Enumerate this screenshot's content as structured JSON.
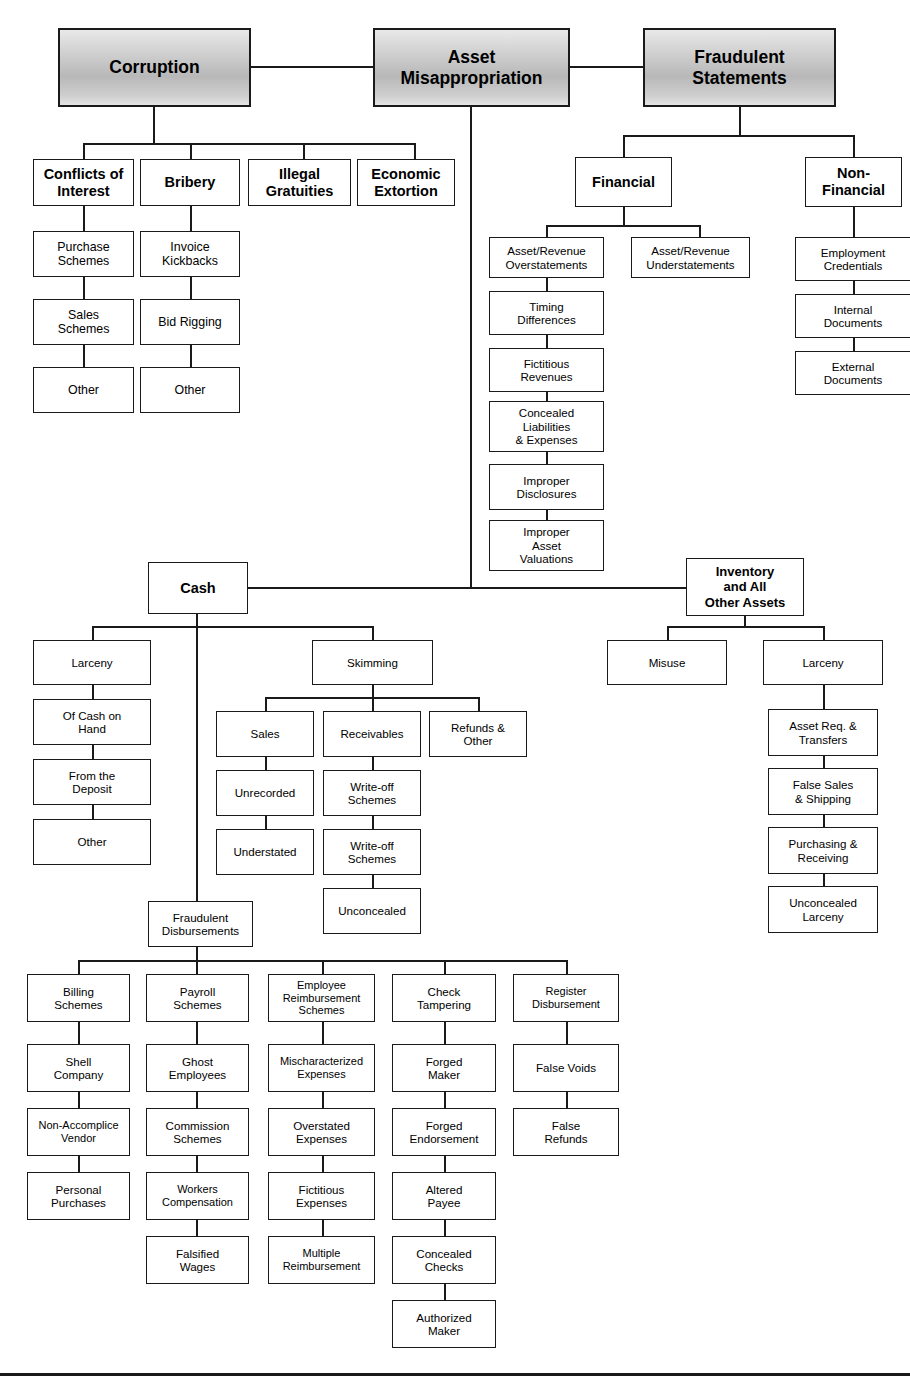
{
  "diagram": {
    "colors": {
      "line": "#1a1a1a",
      "box_fill": "#ffffff",
      "header_fill": "#c8c8c8",
      "text": "#000000"
    }
  },
  "top": {
    "corruption": "Corruption",
    "asset_misappropriation": "Asset\nMisappropriation",
    "asset_misappropriation_l1": "Asset",
    "asset_misappropriation_l2": "Misappropriation",
    "fraudulent_statements_l1": "Fraudulent",
    "fraudulent_statements_l2": "Statements"
  },
  "corruption_branch": {
    "conflicts_of_interest_l1": "Conflicts of",
    "conflicts_of_interest_l2": "Interest",
    "bribery": "Bribery",
    "illegal_gratuities_l1": "Illegal",
    "illegal_gratuities_l2": "Gratuities",
    "economic_extortion_l1": "Economic",
    "economic_extortion_l2": "Extortion",
    "conflicts_children": {
      "purchase_schemes_l1": "Purchase",
      "purchase_schemes_l2": "Schemes",
      "sales_schemes_l1": "Sales",
      "sales_schemes_l2": "Schemes",
      "other": "Other"
    },
    "bribery_children": {
      "invoice_kickbacks_l1": "Invoice",
      "invoice_kickbacks_l2": "Kickbacks",
      "bid_rigging": "Bid Rigging",
      "other": "Other"
    }
  },
  "fraudulent_statements_branch": {
    "financial": "Financial",
    "non_financial_l1": "Non-",
    "non_financial_l2": "Financial",
    "financial_children": {
      "overstatements_l1": "Asset/Revenue",
      "overstatements_l2": "Overstatements",
      "understatements_l1": "Asset/Revenue",
      "understatements_l2": "Understatements",
      "timing_differences_l1": "Timing",
      "timing_differences_l2": "Differences",
      "fictitious_revenues_l1": "Fictitious",
      "fictitious_revenues_l2": "Revenues",
      "concealed_liabilities_l1": "Concealed",
      "concealed_liabilities_l2": "Liabilities",
      "concealed_liabilities_l3": "& Expenses",
      "improper_disclosures_l1": "Improper",
      "improper_disclosures_l2": "Disclosures",
      "improper_asset_valuations_l1": "Improper",
      "improper_asset_valuations_l2": "Asset",
      "improper_asset_valuations_l3": "Valuations"
    },
    "non_financial_children": {
      "employment_credentials_l1": "Employment",
      "employment_credentials_l2": "Credentials",
      "internal_documents_l1": "Internal",
      "internal_documents_l2": "Documents",
      "external_documents_l1": "External",
      "external_documents_l2": "Documents"
    }
  },
  "cash_branch": {
    "cash": "Cash",
    "larceny": "Larceny",
    "larceny_children": {
      "of_cash_on_hand_l1": "Of Cash on",
      "of_cash_on_hand_l2": "Hand",
      "from_the_deposit_l1": "From the",
      "from_the_deposit_l2": "Deposit",
      "other": "Other"
    },
    "skimming": "Skimming",
    "skimming_children": {
      "sales": "Sales",
      "receivables": "Receivables",
      "refunds_other_l1": "Refunds &",
      "refunds_other_l2": "Other",
      "unrecorded": "Unrecorded",
      "understated": "Understated",
      "write_off_schemes_a_l1": "Write-off",
      "write_off_schemes_a_l2": "Schemes",
      "write_off_schemes_b_l1": "Write-off",
      "write_off_schemes_b_l2": "Schemes",
      "unconcealed": "Unconcealed"
    },
    "fraudulent_disbursements_l1": "Fraudulent",
    "fraudulent_disbursements_l2": "Disbursements",
    "disbursements": {
      "billing_schemes_l1": "Billing",
      "billing_schemes_l2": "Schemes",
      "payroll_schemes_l1": "Payroll",
      "payroll_schemes_l2": "Schemes",
      "employee_reimbursement_l1": "Employee",
      "employee_reimbursement_l2": "Reimbursement",
      "employee_reimbursement_l3": "Schemes",
      "check_tampering_l1": "Check",
      "check_tampering_l2": "Tampering",
      "register_disbursement_l1": "Register",
      "register_disbursement_l2": "Disbursement",
      "shell_company_l1": "Shell",
      "shell_company_l2": "Company",
      "non_accomplice_vendor_l1": "Non-Accomplice",
      "non_accomplice_vendor_l2": "Vendor",
      "personal_purchases_l1": "Personal",
      "personal_purchases_l2": "Purchases",
      "ghost_employees_l1": "Ghost",
      "ghost_employees_l2": "Employees",
      "commission_schemes_l1": "Commission",
      "commission_schemes_l2": "Schemes",
      "workers_compensation_l1": "Workers",
      "workers_compensation_l2": "Compensation",
      "falsified_wages_l1": "Falsified",
      "falsified_wages_l2": "Wages",
      "mischaracterized_expenses_l1": "Mischaracterized",
      "mischaracterized_expenses_l2": "Expenses",
      "overstated_expenses_l1": "Overstated",
      "overstated_expenses_l2": "Expenses",
      "fictitious_expenses_l1": "Fictitious",
      "fictitious_expenses_l2": "Expenses",
      "multiple_reimbursement_l1": "Multiple",
      "multiple_reimbursement_l2": "Reimbursement",
      "forged_maker_l1": "Forged",
      "forged_maker_l2": "Maker",
      "forged_endorsement_l1": "Forged",
      "forged_endorsement_l2": "Endorsement",
      "altered_payee_l1": "Altered",
      "altered_payee_l2": "Payee",
      "concealed_checks_l1": "Concealed",
      "concealed_checks_l2": "Checks",
      "authorized_maker_l1": "Authorized",
      "authorized_maker_l2": "Maker",
      "false_voids": "False Voids",
      "false_refunds_l1": "False",
      "false_refunds_l2": "Refunds"
    }
  },
  "inventory_branch": {
    "inventory_l1": "Inventory",
    "inventory_l2": "and All",
    "inventory_l3": "Other Assets",
    "misuse": "Misuse",
    "larceny": "Larceny",
    "larceny_children": {
      "asset_req_transfers_l1": "Asset Req. &",
      "asset_req_transfers_l2": "Transfers",
      "false_sales_shipping_l1": "False Sales",
      "false_sales_shipping_l2": "& Shipping",
      "purchasing_receiving_l1": "Purchasing &",
      "purchasing_receiving_l2": "Receiving",
      "unconcealed_larceny_l1": "Unconcealed",
      "unconcealed_larceny_l2": "Larceny"
    }
  }
}
